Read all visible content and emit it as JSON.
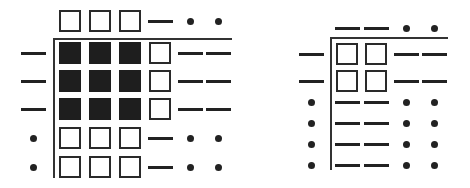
{
  "legend": {
    "filled": "filled-square",
    "open": "open-square",
    "dash": "dash",
    "dot": "dot"
  },
  "colors": {
    "ink": "#222222",
    "background": "#ffffff"
  },
  "figures": [
    {
      "name": "left-matrix",
      "axis": {
        "x": 53,
        "y": 38,
        "v_end": 178,
        "h_end": 232
      },
      "header_y": 21,
      "row_label_x": 33,
      "col_x": [
        70,
        100,
        130,
        160,
        190,
        218
      ],
      "row_y": [
        53,
        81,
        109,
        138,
        167
      ],
      "header": [
        "open",
        "open",
        "open",
        "dash",
        "dot",
        "dot"
      ],
      "rows": [
        {
          "label": "dash",
          "cells": [
            "filled",
            "filled",
            "filled",
            "open",
            "dash",
            "dash"
          ]
        },
        {
          "label": "dash",
          "cells": [
            "filled",
            "filled",
            "filled",
            "open",
            "dash",
            "dash"
          ]
        },
        {
          "label": "dash",
          "cells": [
            "filled",
            "filled",
            "filled",
            "open",
            "dash",
            "dash"
          ]
        },
        {
          "label": "dot",
          "cells": [
            "open",
            "open",
            "open",
            "dash",
            "dot",
            "dot"
          ]
        },
        {
          "label": "dot",
          "cells": [
            "open",
            "open",
            "open",
            "dash",
            "dot",
            "dot"
          ]
        }
      ]
    },
    {
      "name": "right-matrix",
      "axis": {
        "x": 330,
        "y": 37,
        "v_end": 170,
        "h_end": 448
      },
      "header_y": 28,
      "row_label_x": 311,
      "col_x": [
        347,
        376,
        406,
        434
      ],
      "row_y": [
        54,
        81,
        102,
        123,
        144,
        165
      ],
      "header": [
        "dash",
        "dash",
        "dot",
        "dot"
      ],
      "rows": [
        {
          "label": "dash",
          "cells": [
            "open",
            "open",
            "dash",
            "dash"
          ]
        },
        {
          "label": "dash",
          "cells": [
            "open",
            "open",
            "dash",
            "dash"
          ]
        },
        {
          "label": "dot",
          "cells": [
            "dash",
            "dash",
            "dot",
            "dot"
          ]
        },
        {
          "label": "dot",
          "cells": [
            "dash",
            "dash",
            "dot",
            "dot"
          ]
        },
        {
          "label": "dot",
          "cells": [
            "dash",
            "dash",
            "dot",
            "dot"
          ]
        },
        {
          "label": "dot",
          "cells": [
            "dash",
            "dash",
            "dot",
            "dot"
          ]
        }
      ]
    }
  ]
}
